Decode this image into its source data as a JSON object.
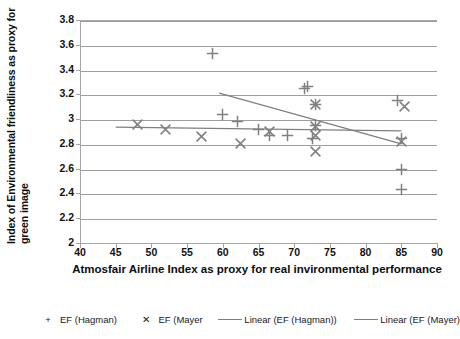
{
  "chart_data": {
    "type": "scatter",
    "title": "",
    "xlabel": "Atmosfair Airline Index as proxy for real invironmental performance",
    "ylabel_line1": "Index of Environmental friendliness as proxy for",
    "ylabel_line2": "green image",
    "xlim": [
      40,
      90
    ],
    "ylim": [
      2,
      3.8
    ],
    "xticks": [
      40,
      45,
      50,
      55,
      60,
      65,
      70,
      75,
      80,
      85,
      90
    ],
    "yticks": [
      2,
      2.2,
      2.4,
      2.6,
      2.8,
      3,
      3.2,
      3.4,
      3.6,
      3.8
    ],
    "xtick_labels": [
      "40",
      "45",
      "50",
      "55",
      "60",
      "65",
      "70",
      "75",
      "80",
      "85",
      "90"
    ],
    "ytick_labels": [
      "2",
      "2.2",
      "2.4",
      "2.6",
      "2.8",
      "3",
      "3.2",
      "3.4",
      "3.6",
      "3.8"
    ],
    "grid": "horizontal",
    "legend_position": "bottom",
    "marker_color": "#808080",
    "line_color": "#7f7f7f",
    "grid_color": "#9e9e9e",
    "series": [
      {
        "name": "EF (Hagman)",
        "marker": "plus",
        "points": [
          [
            58.5,
            3.53
          ],
          [
            60.0,
            3.04
          ],
          [
            62.0,
            2.98
          ],
          [
            65.0,
            2.92
          ],
          [
            66.5,
            2.87
          ],
          [
            69.0,
            2.87
          ],
          [
            71.5,
            3.25
          ],
          [
            71.9,
            3.26
          ],
          [
            72.6,
            2.84
          ],
          [
            73.0,
            3.12
          ],
          [
            73.0,
            2.95
          ],
          [
            84.5,
            3.15
          ],
          [
            85.0,
            2.84
          ],
          [
            85.0,
            2.59
          ],
          [
            85.0,
            2.43
          ]
        ]
      },
      {
        "name": "EF (Mayer",
        "marker": "cross",
        "points": [
          [
            48.0,
            2.96
          ],
          [
            52.0,
            2.92
          ],
          [
            57.0,
            2.86
          ],
          [
            62.5,
            2.8
          ],
          [
            66.5,
            2.9
          ],
          [
            73.0,
            3.12
          ],
          [
            73.0,
            2.94
          ],
          [
            73.0,
            2.87
          ],
          [
            73.0,
            2.74
          ],
          [
            85.5,
            3.1
          ],
          [
            85.0,
            2.82
          ]
        ]
      }
    ],
    "trendlines": [
      {
        "name": "Linear (EF (Hagman))",
        "x_start": 59.5,
        "y_start": 3.21,
        "x_end": 85.0,
        "y_end": 2.8
      },
      {
        "name": "Linear (EF (Mayer)",
        "x_start": 45.0,
        "y_start": 2.935,
        "x_end": 85.0,
        "y_end": 2.905
      }
    ],
    "legend_entries": [
      {
        "label": "EF (Hagman)",
        "symbol": "+",
        "kind": "marker"
      },
      {
        "label": "EF (Mayer",
        "symbol": "✕",
        "kind": "marker"
      },
      {
        "label": "Linear (EF (Hagman))",
        "symbol": "",
        "kind": "line"
      },
      {
        "label": "Linear (EF (Mayer)",
        "symbol": "",
        "kind": "line"
      }
    ]
  }
}
